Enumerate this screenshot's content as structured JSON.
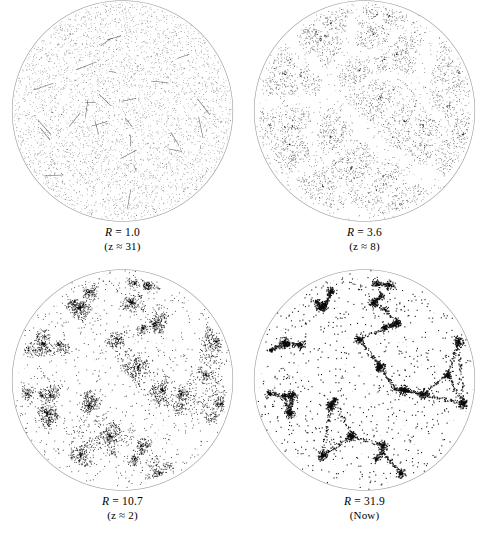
{
  "figure": {
    "type": "scatter",
    "layout": {
      "rows": 2,
      "cols": 2
    },
    "background_color": "#ffffff",
    "point_color": "#1a1a1a",
    "circle_stroke_color": "#8c8c8c"
  },
  "panels": [
    {
      "id": "panel-r-1-0",
      "symbol": "R",
      "equals": "=",
      "value": "1.0",
      "caption_line1": "R = 1.0",
      "caption_line2": "(z ≈ 31)",
      "redshift_symbol": "z",
      "redshift_value": "31",
      "clustering": 0.0,
      "n_points": 4200
    },
    {
      "id": "panel-r-3-6",
      "symbol": "R",
      "equals": "=",
      "value": "3.6",
      "caption_line1": "R = 3.6",
      "caption_line2": "(z ≈ 8)",
      "redshift_symbol": "z",
      "redshift_value": "8",
      "clustering": 0.34,
      "n_points": 4200
    },
    {
      "id": "panel-r-10-7",
      "symbol": "R",
      "equals": "=",
      "value": "10.7",
      "caption_line1": "R = 10.7",
      "caption_line2": "(z ≈ 2)",
      "redshift_symbol": "z",
      "redshift_value": "2",
      "clustering": 0.68,
      "n_points": 4200
    },
    {
      "id": "panel-r-31-9",
      "symbol": "R",
      "equals": "=",
      "value": "31.9",
      "caption_line1": "R = 31.9",
      "caption_line2": "(Now)",
      "redshift_symbol": "",
      "redshift_value": "Now",
      "clustering": 1.0,
      "n_points": 4200
    }
  ],
  "chart_data": {
    "type": "scatter",
    "title": "",
    "xlabel": "",
    "ylabel": "",
    "grid": false,
    "legend": null,
    "panels": [
      {
        "label": "R = 1.0",
        "sublabel": "(z ≈ 31)",
        "expansion_factor": 1.0,
        "redshift": 31,
        "clustering_strength": 0.0
      },
      {
        "label": "R = 3.6",
        "sublabel": "(z ≈ 8)",
        "expansion_factor": 3.6,
        "redshift": 8,
        "clustering_strength": 0.34
      },
      {
        "label": "R = 10.7",
        "sublabel": "(z ≈ 2)",
        "expansion_factor": 10.7,
        "redshift": 2,
        "clustering_strength": 0.68
      },
      {
        "label": "R = 31.9",
        "sublabel": "(Now)",
        "expansion_factor": 31.9,
        "redshift": 0,
        "clustering_strength": 1.0
      }
    ]
  }
}
